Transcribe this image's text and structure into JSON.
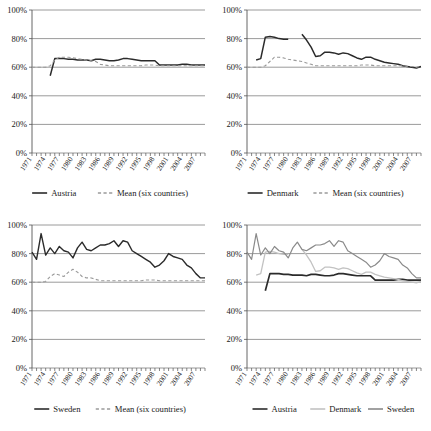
{
  "figure": {
    "panel_count": 4,
    "y_ticks": [
      "0%",
      "20%",
      "40%",
      "60%",
      "80%",
      "100%"
    ],
    "x_tick_labels": [
      "1971",
      "1974",
      "1977",
      "1980",
      "1983",
      "1986",
      "1989",
      "1992",
      "1995",
      "1998",
      "2001",
      "2004",
      "2007"
    ],
    "colors": {
      "austria": "#2b2b2b",
      "denmark": "#c2c2c2",
      "sweden": "#8a8a8a",
      "mean": "#9a9a9a",
      "grid": "#8e8e8e",
      "axis": "#555555",
      "text": "#1a1a1a"
    }
  },
  "chart_data": [
    {
      "id": "panel-austria",
      "type": "line",
      "title": "",
      "xlabel": "",
      "ylabel": "",
      "ylim": [
        0,
        100
      ],
      "xlim": [
        1971,
        2009
      ],
      "grid": true,
      "legend_position": "bottom",
      "x": [
        1971,
        1972,
        1973,
        1974,
        1975,
        1976,
        1977,
        1978,
        1979,
        1980,
        1981,
        1982,
        1983,
        1984,
        1985,
        1986,
        1987,
        1988,
        1989,
        1990,
        1991,
        1992,
        1993,
        1994,
        1995,
        1996,
        1997,
        1998,
        1999,
        2000,
        2001,
        2002,
        2003,
        2004,
        2005,
        2006,
        2007,
        2008,
        2009
      ],
      "series": [
        {
          "name": "Austria",
          "color": "#2b2b2b",
          "dash": false,
          "width": 1.5,
          "values": [
            null,
            null,
            null,
            null,
            54,
            66,
            66,
            66,
            65.5,
            65.5,
            65,
            65,
            65,
            64.5,
            65.5,
            65.5,
            65,
            64.5,
            64.5,
            65,
            66,
            66,
            65.5,
            65,
            64.5,
            64.5,
            64.5,
            64.5,
            61.5,
            61.5,
            61.5,
            61.5,
            61.5,
            62,
            62,
            61.5,
            61.5,
            61.5,
            61.5
          ]
        },
        {
          "name": "Mean (six countries)",
          "color": "#9a9a9a",
          "dash": true,
          "width": 1.1,
          "values": [
            60,
            60,
            60,
            60,
            61,
            65,
            67,
            67,
            67,
            66.5,
            66,
            65.5,
            65,
            64.5,
            64,
            62,
            61.5,
            61,
            61,
            61,
            61,
            61,
            61,
            61,
            61,
            61.5,
            61.5,
            61.5,
            61,
            61,
            61,
            61,
            61,
            61,
            61,
            61,
            61,
            61,
            61
          ]
        }
      ],
      "legend": [
        {
          "label": "Austria",
          "color": "#2b2b2b",
          "dash": false
        },
        {
          "label": "Mean (six countries)",
          "color": "#9a9a9a",
          "dash": true
        }
      ]
    },
    {
      "id": "panel-denmark",
      "type": "line",
      "title": "",
      "xlabel": "",
      "ylabel": "",
      "ylim": [
        0,
        100
      ],
      "xlim": [
        1971,
        2009
      ],
      "grid": true,
      "legend_position": "bottom",
      "x": [
        1971,
        1972,
        1973,
        1974,
        1975,
        1976,
        1977,
        1978,
        1979,
        1980,
        1981,
        1982,
        1983,
        1984,
        1985,
        1986,
        1987,
        1988,
        1989,
        1990,
        1991,
        1992,
        1993,
        1994,
        1995,
        1996,
        1997,
        1998,
        1999,
        2000,
        2001,
        2002,
        2003,
        2004,
        2005,
        2006,
        2007,
        2008,
        2009
      ],
      "series": [
        {
          "name": "Denmark",
          "color": "#2b2b2b",
          "dash": false,
          "width": 1.5,
          "values": [
            null,
            null,
            65,
            66,
            81,
            81.5,
            81,
            80,
            79.5,
            79.5,
            null,
            null,
            83,
            79,
            74,
            67.5,
            68,
            70.5,
            70.5,
            70,
            69,
            70,
            69.5,
            68,
            66.5,
            65.5,
            67,
            67,
            65.5,
            64.5,
            63.5,
            63,
            62.5,
            62,
            61,
            60.5,
            60,
            59.5,
            60.5
          ]
        },
        {
          "name": "Mean (six countries)",
          "color": "#9a9a9a",
          "dash": true,
          "width": 1.1,
          "values": [
            60,
            60,
            60,
            60,
            61,
            64,
            67,
            67,
            66.5,
            65.5,
            65,
            64.5,
            64,
            63,
            62,
            61,
            61,
            61,
            61,
            61,
            61,
            61,
            61,
            61,
            61,
            61.5,
            61.5,
            61.5,
            61,
            61,
            61,
            61,
            61,
            61,
            61,
            60.5,
            60.5,
            60,
            60.5
          ]
        }
      ],
      "legend": [
        {
          "label": "Denmark",
          "color": "#2b2b2b",
          "dash": false
        },
        {
          "label": "Mean (six countries)",
          "color": "#9a9a9a",
          "dash": true
        }
      ]
    },
    {
      "id": "panel-sweden",
      "type": "line",
      "title": "",
      "xlabel": "",
      "ylabel": "",
      "ylim": [
        0,
        100
      ],
      "xlim": [
        1971,
        2009
      ],
      "grid": true,
      "legend_position": "bottom",
      "x": [
        1971,
        1972,
        1973,
        1974,
        1975,
        1976,
        1977,
        1978,
        1979,
        1980,
        1981,
        1982,
        1983,
        1984,
        1985,
        1986,
        1987,
        1988,
        1989,
        1990,
        1991,
        1992,
        1993,
        1994,
        1995,
        1996,
        1997,
        1998,
        1999,
        2000,
        2001,
        2002,
        2003,
        2004,
        2005,
        2006,
        2007,
        2008,
        2009
      ],
      "series": [
        {
          "name": "Sweden",
          "color": "#2b2b2b",
          "dash": false,
          "width": 1.4,
          "values": [
            81,
            76,
            94,
            79,
            84,
            80,
            85,
            82,
            81,
            77,
            84,
            88,
            83,
            82,
            84,
            86,
            86,
            87,
            89,
            85,
            89,
            88,
            82,
            80,
            78,
            76,
            74,
            70.5,
            72,
            75,
            80,
            78,
            77,
            76,
            72,
            70,
            66,
            63,
            63
          ]
        },
        {
          "name": "Mean (six countries)",
          "color": "#9a9a9a",
          "dash": true,
          "width": 1.1,
          "values": [
            60,
            60,
            60,
            60.5,
            64,
            66,
            65,
            64,
            67,
            69,
            67,
            64,
            63,
            63,
            62,
            61,
            61,
            61,
            61,
            61,
            61,
            61,
            61,
            61,
            61,
            61.5,
            61.5,
            61.5,
            61,
            61,
            61,
            61,
            61,
            61,
            61,
            61,
            61,
            61,
            61
          ]
        }
      ],
      "legend": [
        {
          "label": "Sweden",
          "color": "#2b2b2b",
          "dash": false
        },
        {
          "label": "Mean (six countries)",
          "color": "#9a9a9a",
          "dash": true
        }
      ]
    },
    {
      "id": "panel-combined",
      "type": "line",
      "title": "",
      "xlabel": "",
      "ylabel": "",
      "ylim": [
        0,
        100
      ],
      "xlim": [
        1971,
        2009
      ],
      "grid": true,
      "legend_position": "bottom",
      "x": [
        1971,
        1972,
        1973,
        1974,
        1975,
        1976,
        1977,
        1978,
        1979,
        1980,
        1981,
        1982,
        1983,
        1984,
        1985,
        1986,
        1987,
        1988,
        1989,
        1990,
        1991,
        1992,
        1993,
        1994,
        1995,
        1996,
        1997,
        1998,
        1999,
        2000,
        2001,
        2002,
        2003,
        2004,
        2005,
        2006,
        2007,
        2008,
        2009
      ],
      "series": [
        {
          "name": "Austria",
          "color": "#2b2b2b",
          "dash": false,
          "width": 1.7,
          "values": [
            null,
            null,
            null,
            null,
            54,
            66,
            66,
            66,
            65.5,
            65.5,
            65,
            65,
            65,
            64.5,
            65.5,
            65.5,
            65,
            64.5,
            64.5,
            65,
            66,
            66,
            65.5,
            65,
            64.5,
            64.5,
            64.5,
            64.5,
            61.5,
            61.5,
            61.5,
            61.5,
            61.5,
            62,
            62,
            61.5,
            61.5,
            61.5,
            61.5
          ]
        },
        {
          "name": "Denmark",
          "color": "#c2c2c2",
          "dash": false,
          "width": 1.3,
          "values": [
            null,
            null,
            65,
            66,
            81,
            81.5,
            81,
            80,
            79.5,
            79.5,
            null,
            null,
            83,
            79,
            74,
            67.5,
            68,
            70.5,
            70.5,
            70,
            69,
            70,
            69.5,
            68,
            66.5,
            65.5,
            67,
            67,
            65.5,
            64.5,
            63.5,
            63,
            62.5,
            62,
            61,
            60.5,
            60,
            59.5,
            60.5
          ]
        },
        {
          "name": "Sweden",
          "color": "#8a8a8a",
          "dash": false,
          "width": 1.2,
          "values": [
            81,
            76,
            94,
            79,
            84,
            80,
            85,
            82,
            81,
            77,
            84,
            88,
            83,
            82,
            84,
            86,
            86,
            87,
            89,
            85,
            89,
            88,
            82,
            80,
            78,
            76,
            74,
            70.5,
            72,
            75,
            80,
            78,
            77,
            76,
            72,
            70,
            66,
            63,
            63
          ]
        }
      ],
      "legend": [
        {
          "label": "Austria",
          "color": "#2b2b2b",
          "dash": false
        },
        {
          "label": "Denmark",
          "color": "#c2c2c2",
          "dash": false
        },
        {
          "label": "Sweden",
          "color": "#8a8a8a",
          "dash": false
        }
      ]
    }
  ]
}
